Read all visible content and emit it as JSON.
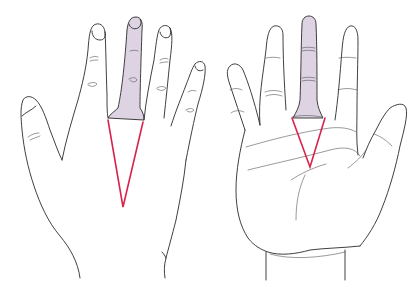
{
  "figure": {
    "colors": {
      "outline": "#2a2a2a",
      "highlight_fill": "#ddd3e3",
      "v_line": "#d8234a",
      "background": "#ffffff"
    },
    "panels": [
      {
        "id": "back-of-hand",
        "highlighted_finger": "middle",
        "v_apex": [
          123,
          207
        ]
      },
      {
        "id": "palm-of-hand",
        "highlighted_finger": "middle",
        "v_apex": [
          310,
          167
        ]
      }
    ]
  }
}
